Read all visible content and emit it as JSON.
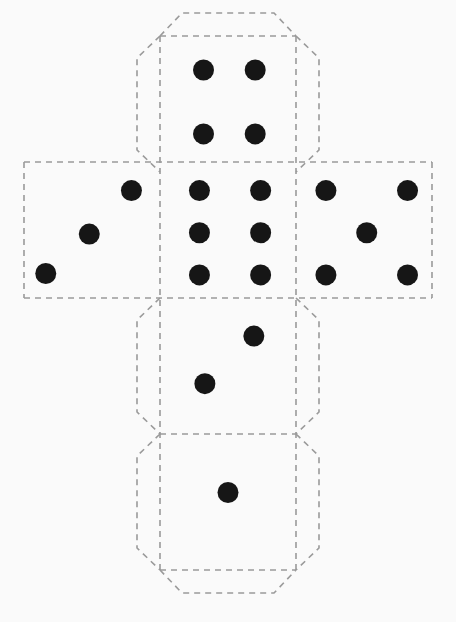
{
  "figure": {
    "background_color": "#fafafa",
    "line_color": "#9a9a9a",
    "pip_color": "#161616",
    "line_width": 1.6,
    "dash_pattern": "6,5",
    "canvas": {
      "width": 456,
      "height": 622
    }
  },
  "geometry": {
    "cell_size": 136,
    "flap_depth": 23,
    "flap_chamfer": 22,
    "grid_x": [
      24,
      160,
      296,
      432
    ],
    "grid_y": [
      36,
      162,
      298,
      434,
      570
    ],
    "pip_radius": 10.5
  },
  "net": {
    "layout": "latin-cross",
    "columns": 3,
    "rows": 4,
    "faces": [
      {
        "id": "face-top",
        "name": "top-face",
        "value": 4,
        "pattern": "four",
        "col": 1,
        "row": 0,
        "x": 160,
        "y": 36,
        "pips": [
          {
            "cx": 0.32,
            "cy": 0.25
          },
          {
            "cx": 0.7,
            "cy": 0.25
          },
          {
            "cx": 0.32,
            "cy": 0.72
          },
          {
            "cx": 0.7,
            "cy": 0.72
          }
        ],
        "flaps": [
          "top",
          "left",
          "right"
        ]
      },
      {
        "id": "face-left",
        "name": "left-face",
        "value": 3,
        "pattern": "three-diagonal",
        "col": 0,
        "row": 1,
        "x": 24,
        "y": 162,
        "pips": [
          {
            "cx": 0.16,
            "cy": 0.82
          },
          {
            "cx": 0.48,
            "cy": 0.53
          },
          {
            "cx": 0.79,
            "cy": 0.21
          }
        ],
        "flaps": []
      },
      {
        "id": "face-center",
        "name": "center-face",
        "value": 6,
        "pattern": "six",
        "col": 1,
        "row": 1,
        "x": 160,
        "y": 162,
        "pips": [
          {
            "cx": 0.29,
            "cy": 0.21
          },
          {
            "cx": 0.74,
            "cy": 0.21
          },
          {
            "cx": 0.29,
            "cy": 0.52
          },
          {
            "cx": 0.74,
            "cy": 0.52
          },
          {
            "cx": 0.29,
            "cy": 0.83
          },
          {
            "cx": 0.74,
            "cy": 0.83
          }
        ],
        "flaps": []
      },
      {
        "id": "face-right",
        "name": "right-face",
        "value": 5,
        "pattern": "five",
        "col": 2,
        "row": 1,
        "x": 296,
        "y": 162,
        "pips": [
          {
            "cx": 0.22,
            "cy": 0.21
          },
          {
            "cx": 0.82,
            "cy": 0.21
          },
          {
            "cx": 0.52,
            "cy": 0.52
          },
          {
            "cx": 0.22,
            "cy": 0.83
          },
          {
            "cx": 0.82,
            "cy": 0.83
          }
        ],
        "flaps": []
      },
      {
        "id": "face-lower",
        "name": "lower-face",
        "value": 2,
        "pattern": "two-diagonal",
        "col": 1,
        "row": 2,
        "x": 160,
        "y": 298,
        "pips": [
          {
            "cx": 0.33,
            "cy": 0.63
          },
          {
            "cx": 0.69,
            "cy": 0.28
          }
        ],
        "flaps": [
          "left",
          "right"
        ]
      },
      {
        "id": "face-bottom",
        "name": "bottom-face",
        "value": 1,
        "pattern": "one",
        "col": 1,
        "row": 3,
        "x": 160,
        "y": 434,
        "pips": [
          {
            "cx": 0.5,
            "cy": 0.43
          }
        ],
        "flaps": [
          "left",
          "right",
          "bottom"
        ]
      }
    ],
    "fold_lines": [
      {
        "name": "fold-horizontal-row1-top",
        "x1": 24,
        "y1": 162,
        "x2": 432,
        "y2": 162
      },
      {
        "name": "fold-horizontal-row1-bottom",
        "x1": 24,
        "y1": 298,
        "x2": 432,
        "y2": 298
      },
      {
        "name": "fold-horizontal-row2-bottom",
        "x1": 160,
        "y1": 434,
        "x2": 296,
        "y2": 434
      },
      {
        "name": "fold-horizontal-row3-bottom",
        "x1": 160,
        "y1": 570,
        "x2": 296,
        "y2": 570
      },
      {
        "name": "fold-horizontal-top-edge",
        "x1": 160,
        "y1": 36,
        "x2": 296,
        "y2": 36
      },
      {
        "name": "fold-vertical-left",
        "x1": 160,
        "y1": 36,
        "x2": 160,
        "y2": 570
      },
      {
        "name": "fold-vertical-right",
        "x1": 296,
        "y1": 36,
        "x2": 296,
        "y2": 570
      },
      {
        "name": "fold-vertical-far-left",
        "x1": 24,
        "y1": 162,
        "x2": 24,
        "y2": 298
      },
      {
        "name": "fold-vertical-far-right",
        "x1": 432,
        "y1": 162,
        "x2": 432,
        "y2": 298
      }
    ]
  },
  "summary": {
    "total_faces": 6,
    "face_values": [
      4,
      3,
      6,
      5,
      2,
      1
    ],
    "opposite_pairs": "1-6, 2-5, 3-4"
  }
}
